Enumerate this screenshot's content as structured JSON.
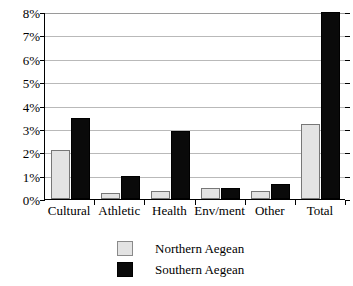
{
  "chart_data": {
    "type": "bar",
    "title": "",
    "xlabel": "",
    "ylabel": "",
    "categories": [
      "Cultural",
      "Athletic",
      "Health",
      "Env/ment",
      "Other",
      "Total"
    ],
    "series": [
      {
        "name": "Northern Aegean",
        "color": "#e3e3e3",
        "values": [
          2.1,
          0.25,
          0.35,
          0.45,
          0.35,
          3.2
        ]
      },
      {
        "name": "Southern Aegean",
        "color": "#0a0a0a",
        "values": [
          3.45,
          1.0,
          2.9,
          0.45,
          0.65,
          8.0
        ]
      }
    ],
    "ylim": [
      0,
      8
    ],
    "ytick_values": [
      0,
      1,
      2,
      3,
      4,
      5,
      6,
      7,
      8
    ],
    "ytick_labels": [
      "0%",
      "1%",
      "2%",
      "3%",
      "4%",
      "5%",
      "6%",
      "7%",
      "8%"
    ],
    "grid": true,
    "legend_position": "bottom"
  },
  "legend": {
    "items": [
      {
        "label": "Northern Aegean"
      },
      {
        "label": "Southern Aegean"
      }
    ]
  }
}
